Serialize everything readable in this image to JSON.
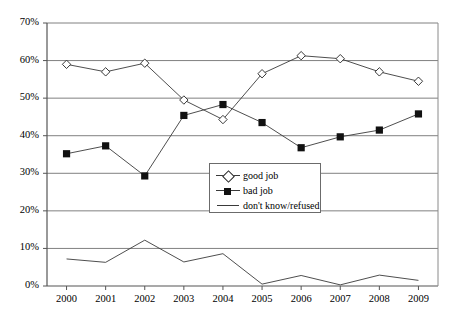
{
  "chart_data": {
    "type": "line",
    "title": "",
    "subtitle": "",
    "xlabel": "",
    "ylabel": "",
    "categories": [
      "2000",
      "2001",
      "2002",
      "2003",
      "2004",
      "2005",
      "2006",
      "2007",
      "2008",
      "2009"
    ],
    "ylim": [
      0,
      70
    ],
    "yticks": [
      0,
      10,
      20,
      30,
      40,
      50,
      60,
      70
    ],
    "ytick_labels": [
      "0%",
      "10%",
      "20%",
      "30%",
      "40%",
      "50%",
      "60%",
      "70%"
    ],
    "grid": "horizontal",
    "legend_position": "center",
    "series": [
      {
        "name": "good job",
        "marker": "open-diamond",
        "values": [
          59.0,
          57.0,
          59.3,
          49.5,
          44.3,
          56.5,
          61.3,
          60.5,
          57.0,
          54.5
        ]
      },
      {
        "name": "bad job",
        "marker": "filled-square",
        "values": [
          35.2,
          37.3,
          29.3,
          45.4,
          48.3,
          43.5,
          36.8,
          39.7,
          41.5,
          45.8
        ]
      },
      {
        "name": "don't know/refused",
        "marker": "none",
        "values": [
          7.2,
          6.3,
          12.2,
          6.4,
          8.6,
          0.5,
          2.8,
          0.3,
          2.9,
          1.5
        ]
      }
    ],
    "colors": {
      "line": "#3a3a3a",
      "grid": "#808080",
      "axis": "#555555",
      "marker_fill_open": "#ffffff",
      "marker_fill_solid": "#111111",
      "background": "#ffffff"
    }
  },
  "legend": {
    "items": [
      {
        "label": "good job"
      },
      {
        "label": "bad job"
      },
      {
        "label": "don't know/refused"
      }
    ]
  }
}
